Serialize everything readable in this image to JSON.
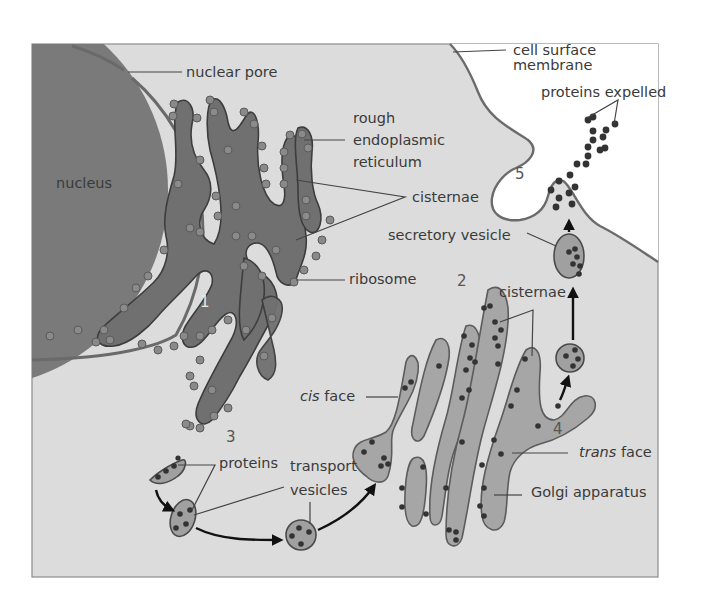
{
  "figure": {
    "colors": {
      "cytoplasm": "#dcdcdc",
      "extracellular": "#ffffff",
      "nucleus": "#7a7a7a",
      "rough_er": "#707070",
      "golgi": "#a6a6a6",
      "protein_dot": "#333333",
      "border": "#888888"
    }
  },
  "labels": {
    "nucleus": "nucleus",
    "nuclear_pore": "nuclear pore",
    "rough_er_line1": "rough",
    "rough_er_line2": "endoplasmic",
    "rough_er_line3": "reticulum",
    "er_cisternae": "cisternae",
    "ribosome": "ribosome",
    "cell_membrane_line1": "cell surface",
    "cell_membrane_line2": "membrane",
    "proteins_expelled": "proteins expelled",
    "secretory_vesicle": "secretory vesicle",
    "golgi_cisternae": "cisternae",
    "cis_face_italic": "cis",
    "cis_face_rest": " face",
    "trans_face_italic": "trans",
    "trans_face_rest": " face",
    "golgi_apparatus": "Golgi apparatus",
    "proteins": "proteins",
    "transport_line1": "transport",
    "transport_line2": "vesicles"
  },
  "steps": {
    "s1": "1",
    "s2": "2",
    "s3": "3",
    "s4": "4",
    "s5": "5"
  }
}
